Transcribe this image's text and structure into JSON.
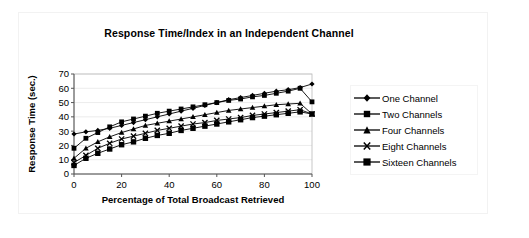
{
  "chart_data": {
    "type": "line",
    "title": "Response Time/Index in an Independent Channel",
    "xlabel": "Percentage of Total Broadcast Retrieved",
    "ylabel": "Response Time (sec.)",
    "xlim": [
      0,
      100
    ],
    "ylim": [
      0,
      70
    ],
    "xticks": [
      0,
      20,
      40,
      60,
      80,
      100
    ],
    "yticks": [
      0,
      10,
      20,
      30,
      40,
      50,
      60,
      70
    ],
    "grid": true,
    "legend_position": "right",
    "x": [
      0,
      5,
      10,
      15,
      20,
      25,
      30,
      35,
      40,
      45,
      50,
      55,
      60,
      65,
      70,
      75,
      80,
      85,
      90,
      95,
      100
    ],
    "series": [
      {
        "name": "One Channel",
        "marker": "diamond",
        "values": [
          28,
          29.5,
          30.5,
          32,
          34,
          36,
          38,
          40,
          42,
          44,
          46,
          48,
          50,
          52,
          53.5,
          55,
          56.5,
          58,
          59,
          60.5,
          63
        ]
      },
      {
        "name": "Two Channels",
        "marker": "square",
        "values": [
          18,
          25,
          29,
          33,
          36.5,
          38.5,
          40.5,
          42.5,
          44,
          45.5,
          47,
          48.5,
          50,
          51.5,
          52.5,
          54,
          55,
          56.5,
          58,
          60,
          50.5
        ]
      },
      {
        "name": "Four Channels",
        "marker": "triangle",
        "values": [
          11,
          18,
          22.5,
          26,
          29,
          31.5,
          34,
          35.5,
          37,
          38.5,
          40,
          41.5,
          43,
          44.5,
          45.5,
          46.5,
          47.5,
          48.5,
          49,
          49.5,
          42
        ]
      },
      {
        "name": "Eight Channels",
        "marker": "cross",
        "values": [
          8,
          13,
          18,
          21.5,
          24.5,
          26.5,
          28.5,
          30.5,
          32,
          33.5,
          35,
          36,
          37.5,
          38.5,
          39.5,
          41,
          42,
          43,
          44,
          45,
          42
        ]
      },
      {
        "name": "Sixteen Channels",
        "marker": "square-lg",
        "values": [
          6,
          11,
          14.5,
          17.5,
          20.5,
          22.5,
          25,
          27,
          28.5,
          30.5,
          32,
          33.5,
          35,
          36.5,
          38,
          39.5,
          40.5,
          41.5,
          42.5,
          43.5,
          42
        ]
      }
    ]
  },
  "legend": {
    "entries": [
      {
        "label": "One Channel"
      },
      {
        "label": "Two Channels"
      },
      {
        "label": "Four Channels"
      },
      {
        "label": "Eight Channels"
      },
      {
        "label": "Sixteen Channels"
      }
    ]
  }
}
